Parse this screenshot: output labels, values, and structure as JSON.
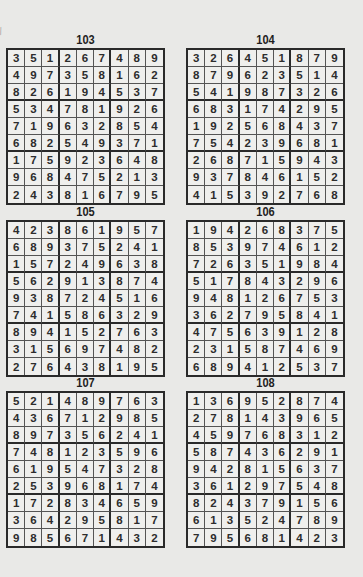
{
  "page": {
    "puzzles": [
      {
        "number": "103",
        "grid": [
          [
            3,
            5,
            1,
            2,
            6,
            7,
            4,
            8,
            9
          ],
          [
            4,
            9,
            7,
            3,
            5,
            8,
            1,
            6,
            2
          ],
          [
            8,
            2,
            6,
            1,
            9,
            4,
            5,
            3,
            7
          ],
          [
            5,
            3,
            4,
            7,
            8,
            1,
            9,
            2,
            6
          ],
          [
            7,
            1,
            9,
            6,
            3,
            2,
            8,
            5,
            4
          ],
          [
            6,
            8,
            2,
            5,
            4,
            9,
            3,
            7,
            1
          ],
          [
            1,
            7,
            5,
            9,
            2,
            3,
            6,
            4,
            8
          ],
          [
            9,
            6,
            8,
            4,
            7,
            5,
            2,
            1,
            3
          ],
          [
            2,
            4,
            3,
            8,
            1,
            6,
            7,
            9,
            5
          ]
        ]
      },
      {
        "number": "104",
        "grid": [
          [
            3,
            2,
            6,
            4,
            5,
            1,
            8,
            7,
            9
          ],
          [
            8,
            7,
            9,
            6,
            2,
            3,
            5,
            1,
            4
          ],
          [
            5,
            4,
            1,
            9,
            8,
            7,
            3,
            2,
            6
          ],
          [
            6,
            8,
            3,
            1,
            7,
            4,
            2,
            9,
            5
          ],
          [
            1,
            9,
            2,
            5,
            6,
            8,
            4,
            3,
            7
          ],
          [
            7,
            5,
            4,
            2,
            3,
            9,
            6,
            8,
            1
          ],
          [
            2,
            6,
            8,
            7,
            1,
            5,
            9,
            4,
            3
          ],
          [
            9,
            3,
            7,
            8,
            4,
            6,
            1,
            5,
            2
          ],
          [
            4,
            1,
            5,
            3,
            9,
            2,
            7,
            6,
            8
          ]
        ]
      },
      {
        "number": "105",
        "grid": [
          [
            4,
            2,
            3,
            8,
            6,
            1,
            9,
            5,
            7
          ],
          [
            6,
            8,
            9,
            3,
            7,
            5,
            2,
            4,
            1
          ],
          [
            1,
            5,
            7,
            2,
            4,
            9,
            6,
            3,
            8
          ],
          [
            5,
            6,
            2,
            9,
            1,
            3,
            8,
            7,
            4
          ],
          [
            9,
            3,
            8,
            7,
            2,
            4,
            5,
            1,
            6
          ],
          [
            7,
            4,
            1,
            5,
            8,
            6,
            3,
            2,
            9
          ],
          [
            8,
            9,
            4,
            1,
            5,
            2,
            7,
            6,
            3
          ],
          [
            3,
            1,
            5,
            6,
            9,
            7,
            4,
            8,
            2
          ],
          [
            2,
            7,
            6,
            4,
            3,
            8,
            1,
            9,
            5
          ]
        ]
      },
      {
        "number": "106",
        "grid": [
          [
            1,
            9,
            4,
            2,
            6,
            8,
            3,
            7,
            5
          ],
          [
            8,
            5,
            3,
            9,
            7,
            4,
            6,
            1,
            2
          ],
          [
            7,
            2,
            6,
            3,
            5,
            1,
            9,
            8,
            4
          ],
          [
            5,
            1,
            7,
            8,
            4,
            3,
            2,
            9,
            6
          ],
          [
            9,
            4,
            8,
            1,
            2,
            6,
            7,
            5,
            3
          ],
          [
            3,
            6,
            2,
            7,
            9,
            5,
            8,
            4,
            1
          ],
          [
            4,
            7,
            5,
            6,
            3,
            9,
            1,
            2,
            8
          ],
          [
            2,
            3,
            1,
            5,
            8,
            7,
            4,
            6,
            9
          ],
          [
            6,
            8,
            9,
            4,
            1,
            2,
            5,
            3,
            7
          ]
        ]
      },
      {
        "number": "107",
        "grid": [
          [
            5,
            2,
            1,
            4,
            8,
            9,
            7,
            6,
            3
          ],
          [
            4,
            3,
            6,
            7,
            1,
            2,
            9,
            8,
            5
          ],
          [
            8,
            9,
            7,
            3,
            5,
            6,
            2,
            4,
            1
          ],
          [
            7,
            4,
            8,
            1,
            2,
            3,
            5,
            9,
            6
          ],
          [
            6,
            1,
            9,
            5,
            4,
            7,
            3,
            2,
            8
          ],
          [
            2,
            5,
            3,
            9,
            6,
            8,
            1,
            7,
            4
          ],
          [
            1,
            7,
            2,
            8,
            3,
            4,
            6,
            5,
            9
          ],
          [
            3,
            6,
            4,
            2,
            9,
            5,
            8,
            1,
            7
          ],
          [
            9,
            8,
            5,
            6,
            7,
            1,
            4,
            3,
            2
          ]
        ]
      },
      {
        "number": "108",
        "grid": [
          [
            1,
            3,
            6,
            9,
            5,
            2,
            8,
            7,
            4
          ],
          [
            2,
            7,
            8,
            1,
            4,
            3,
            9,
            6,
            5
          ],
          [
            4,
            5,
            9,
            7,
            6,
            8,
            3,
            1,
            2
          ],
          [
            5,
            8,
            7,
            4,
            3,
            6,
            2,
            9,
            1
          ],
          [
            9,
            4,
            2,
            8,
            1,
            5,
            6,
            3,
            7
          ],
          [
            3,
            6,
            1,
            2,
            9,
            7,
            5,
            4,
            8
          ],
          [
            8,
            2,
            4,
            3,
            7,
            9,
            1,
            5,
            6
          ],
          [
            6,
            1,
            3,
            5,
            2,
            4,
            7,
            8,
            9
          ],
          [
            7,
            9,
            5,
            6,
            8,
            1,
            4,
            2,
            3
          ]
        ]
      }
    ]
  }
}
